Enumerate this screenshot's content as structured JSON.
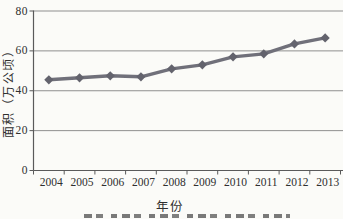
{
  "chart_data": {
    "type": "line",
    "categories": [
      "2004",
      "2005",
      "2006",
      "2007",
      "2008",
      "2009",
      "2010",
      "2011",
      "2012",
      "2013"
    ],
    "values": [
      45.5,
      46.5,
      47.5,
      47,
      51,
      53,
      57,
      58.5,
      63.5,
      66.5
    ],
    "xlabel": "年份",
    "ylabel": "面积（万公顷）",
    "ylim": [
      0,
      80
    ],
    "yticks": [
      0,
      20,
      40,
      60,
      80
    ],
    "grid": "horizontal",
    "legend": "none",
    "marker": "diamond",
    "colors": {
      "line": "#70707a",
      "marker": "#63636d",
      "grid": "#8f8f8f",
      "axis": "#5a5a5a",
      "text": "#2f2f2f",
      "background": "#fbfbf8"
    }
  }
}
